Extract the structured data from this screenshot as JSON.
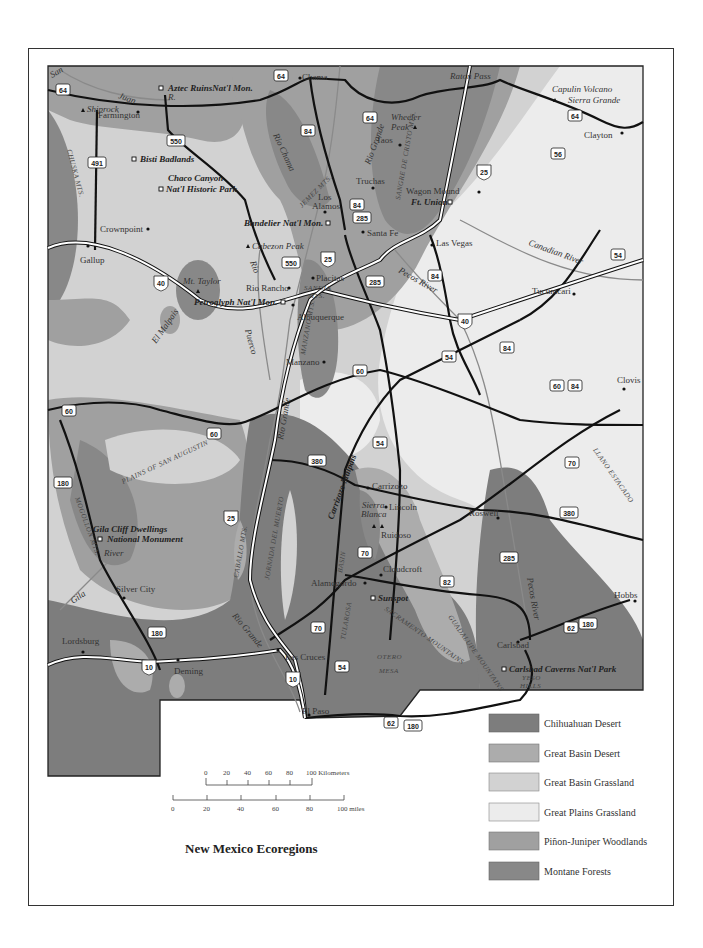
{
  "title": "New Mexico Ecoregions",
  "colors": {
    "chihuahuan_desert": "#7d7d7d",
    "great_basin_desert": "#acacac",
    "great_basin_grassland": "#d2d2d2",
    "great_plains_grassland": "#ececec",
    "pinon_juniper": "#a0a0a0",
    "montane_forests": "#888888",
    "road_black": "#111111",
    "river": "#8a8a8a"
  },
  "legend": [
    {
      "label": "Chihuahuan Desert",
      "color": "#7d7d7d"
    },
    {
      "label": "Great Basin Desert",
      "color": "#acacac"
    },
    {
      "label": "Great Basin Grassland",
      "color": "#d2d2d2"
    },
    {
      "label": "Great Plains Grassland",
      "color": "#ececec"
    },
    {
      "label": "Piñon-Juniper Woodlands",
      "color": "#a0a0a0"
    },
    {
      "label": "Montane Forests",
      "color": "#888888"
    }
  ],
  "scale": {
    "km_label": "100 Kilometers",
    "km_ticks": [
      "0",
      "20",
      "40",
      "60",
      "80"
    ],
    "mi_label": "100 miles",
    "mi_ticks": [
      "0",
      "20",
      "40",
      "60",
      "80"
    ]
  },
  "cities": {
    "chama": "Chama",
    "farmington": "Farmington",
    "shiprock": "Shiprock",
    "taos": "Taos",
    "truchas": "Truchas",
    "los_alamos_1": "Los",
    "los_alamos_2": "Alamos",
    "santa_fe": "Santa Fe",
    "wagon_mound": "Wagon Mound",
    "las_vegas": "Las Vegas",
    "clayton": "Clayton",
    "crownpoint": "Crownpoint",
    "gallup": "Gallup",
    "rio_rancho": "Rio Rancho",
    "placitas": "Placitas",
    "albuquerque": "Albuquerque",
    "manzano": "Manzano",
    "tucumcari": "Tucumcari",
    "clovis": "Clovis",
    "carrizozo": "Carrizozo",
    "lincoln": "Lincoln",
    "ruidoso": "Ruidoso",
    "roswell": "Roswell",
    "cloudcroft": "Cloudcroft",
    "alamogordo": "Alamogordo",
    "silver_city": "Silver City",
    "lordsburg": "Lordsburg",
    "deming": "Deming",
    "las_cruces": "Las Cruces",
    "el_paso": "El Paso",
    "carlsbad": "Carlsbad",
    "hobbs": "Hobbs"
  },
  "landmarks": {
    "aztec": "Aztec RuinsNat'l Mon.",
    "bisti": "Bisti Badlands",
    "chaco_1": "Chaco Canyon",
    "chaco_2": "Nat'l Historic Park",
    "bandelier": "Bandelier Nat'l Mon.",
    "petroglyph": "Petroglyph Nat'l Mon.",
    "ft_union": "Ft. Union",
    "gila_1": "Gila Cliff Dwellings",
    "gila_2": "National Monument",
    "sunspot": "Sunspot",
    "carlsbad_caverns": "Carlsbad Caverns Nat'l Park"
  },
  "peaks": {
    "wheeler_1": "Wheeler",
    "wheeler_2": "Peak",
    "capulin": "Capulin Volcano",
    "sierra_grande": "Sierra Grande",
    "cabezon": "Cabezon Peak",
    "mt_taylor": "Mt. Taylor",
    "sierra_blanca_1": "Sierra",
    "sierra_blanca_2": "Blanca",
    "raton_pass": "Raton Pass"
  },
  "features": {
    "san": "San",
    "juan": "Juan",
    "r": "R.",
    "chuska": "CHUSKA MTS.",
    "rio_chama": "Rio Chama",
    "rio_grande_n": "Rio Grande",
    "sangre": "SANGRE DE CRISTO MTS.",
    "jemez": "JEMEZ MTS.",
    "rio_puerco_1": "Rio",
    "rio_puerco_2": "Puerco",
    "sandia_1": "SANDIA",
    "sandia_2": "MTS.",
    "manzano_mts": "MANZANO MTS.",
    "el_malpais": "El Malpais",
    "pecos_river": "Pecos River",
    "canadian_river": "Canadian River",
    "rio_grande_c": "Rio Grande",
    "plains_sa": "PLAINS OF SAN AUGUSTIN",
    "mogollon": "MOGOLLON MTS.",
    "gila_river": "River",
    "gila": "Gila",
    "caballo": "CABALLO MTS.",
    "jornada": "JORNADA DEL MUERTO",
    "carrizozo_malpais": "Carrizozo Malpais",
    "basin": "BASIN",
    "tularosa": "TULAROSA",
    "sacramento": "SACRAMENTO MOUNTAINS",
    "guadalupe": "GUADALUPE MOUNTAINS",
    "otero": "OTERO",
    "mesa": "MESA",
    "llano": "LLANO ESTACADO",
    "pecos_river_s": "Pecos River",
    "yeso_1": "YESO",
    "yeso_2": "HILLS",
    "rio_grande_s": "Rio Grande"
  },
  "shields": {
    "us64a": "64",
    "us64b": "64",
    "us64c": "64",
    "us64d": "64",
    "us550a": "550",
    "us550b": "550",
    "us491": "491",
    "us84a": "84",
    "us84b": "84",
    "us84c": "84",
    "us84d": "84",
    "us84e": "84",
    "us285a": "285",
    "us285b": "285",
    "us285c": "285",
    "i25a": "25",
    "i25b": "25",
    "i25c": "25",
    "us56": "56",
    "i40a": "40",
    "i40b": "40",
    "us54a": "54",
    "us54b": "54",
    "us54c": "54",
    "us54d": "54",
    "us60a": "60",
    "us60b": "60",
    "us60c": "60",
    "us60d": "60",
    "us380a": "380",
    "us380b": "380",
    "us70a": "70",
    "us70b": "70",
    "us70c": "70",
    "us180a": "180",
    "us180b": "180",
    "us180c": "180",
    "us180d": "180",
    "us82": "82",
    "us62a": "62",
    "us62b": "62",
    "i10a": "10",
    "i10b": "10"
  }
}
